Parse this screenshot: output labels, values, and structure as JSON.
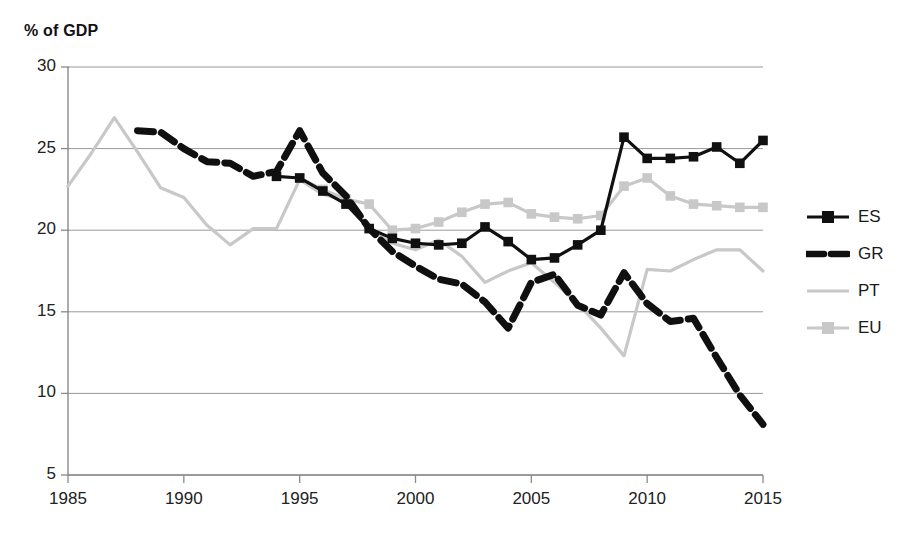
{
  "chart_data": {
    "type": "line",
    "title": "% of GDP",
    "xlabel": "",
    "ylabel": "% of GDP",
    "xlim": [
      1985,
      2015
    ],
    "ylim": [
      5,
      30
    ],
    "ytick_values": [
      5,
      10,
      15,
      20,
      25,
      30
    ],
    "ytick_labels": [
      "5",
      "10",
      "15",
      "20",
      "25",
      "30"
    ],
    "xtick_values": [
      1985,
      1990,
      1995,
      2000,
      2005,
      2010,
      2015
    ],
    "xtick_labels": [
      "1985",
      "1990",
      "1995",
      "2000",
      "2005",
      "2010",
      "2015"
    ],
    "grid": "horizontal",
    "legend_position": "right",
    "series": [
      {
        "name": "ES",
        "label": "ES",
        "color": "#101010",
        "style": "solid-marker",
        "marker": "square",
        "x": [
          1994,
          1995,
          1996,
          1997,
          1998,
          1999,
          2000,
          2001,
          2002,
          2003,
          2004,
          2005,
          2006,
          2007,
          2008,
          2009,
          2010,
          2011,
          2012,
          2013,
          2014,
          2015
        ],
        "y": [
          23.3,
          23.2,
          22.4,
          21.6,
          20.1,
          19.5,
          19.2,
          19.1,
          19.2,
          20.2,
          19.3,
          18.2,
          18.3,
          19.1,
          20.0,
          25.7,
          24.4,
          24.4,
          24.5,
          25.1,
          24.1,
          25.5
        ]
      },
      {
        "name": "GR",
        "label": "GR",
        "color": "#101010",
        "style": "dashed",
        "marker": "none",
        "x": [
          1988,
          1989,
          1990,
          1991,
          1992,
          1993,
          1994,
          1995,
          1996,
          1997,
          1998,
          1999,
          2000,
          2001,
          2002,
          2003,
          2004,
          2005,
          2006,
          2007,
          2008,
          2009,
          2010,
          2011,
          2012,
          2013,
          2014,
          2015
        ],
        "y": [
          26.1,
          26.0,
          25.0,
          24.2,
          24.1,
          23.3,
          23.6,
          26.1,
          23.5,
          22.1,
          20.1,
          18.7,
          17.8,
          17.0,
          16.7,
          15.6,
          14.0,
          16.8,
          17.3,
          15.4,
          14.8,
          17.4,
          15.5,
          14.4,
          14.6,
          12.2,
          9.9,
          8.1
        ]
      },
      {
        "name": "PT",
        "label": "PT",
        "color": "#c8c8c8",
        "style": "solid",
        "marker": "none",
        "x": [
          1985,
          1986,
          1987,
          1988,
          1989,
          1990,
          1991,
          1992,
          1993,
          1994,
          1995,
          1996,
          1997,
          1998,
          1999,
          2000,
          2001,
          2002,
          2003,
          2004,
          2005,
          2006,
          2007,
          2008,
          2009,
          2010,
          2011,
          2012,
          2013,
          2014,
          2015
        ],
        "y": [
          22.7,
          24.7,
          26.9,
          24.8,
          22.6,
          22.0,
          20.3,
          19.1,
          20.1,
          20.1,
          23.1,
          22.2,
          21.8,
          20.0,
          19.2,
          18.8,
          19.4,
          18.4,
          16.8,
          17.5,
          18.0,
          16.8,
          15.5,
          14.0,
          12.3,
          17.6,
          17.5,
          18.2,
          18.8,
          18.8,
          17.5
        ]
      },
      {
        "name": "EU",
        "label": "EU",
        "color": "#c8c8c8",
        "style": "solid-marker",
        "marker": "square",
        "x": [
          1995,
          1996,
          1997,
          1998,
          1999,
          2000,
          2001,
          2002,
          2003,
          2004,
          2005,
          2006,
          2007,
          2008,
          2009,
          2010,
          2011,
          2012,
          2013,
          2014,
          2015
        ],
        "y": [
          23.2,
          22.5,
          21.9,
          21.6,
          20.0,
          20.1,
          20.5,
          21.1,
          21.6,
          21.7,
          21.0,
          20.8,
          20.7,
          20.9,
          22.7,
          23.2,
          22.1,
          21.6,
          21.5,
          21.4,
          21.4
        ]
      }
    ]
  },
  "legend": {
    "items": [
      {
        "label": "ES"
      },
      {
        "label": "GR"
      },
      {
        "label": "PT"
      },
      {
        "label": "EU"
      }
    ]
  }
}
